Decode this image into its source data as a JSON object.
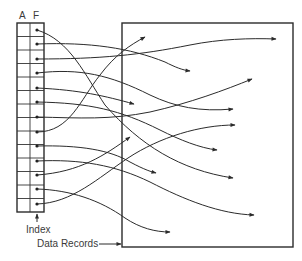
{
  "labels": {
    "col_a": "A",
    "col_f": "F",
    "index": "Index",
    "data_records": "Data Records"
  },
  "index_table": {
    "columns": [
      "A",
      "F"
    ],
    "row_count": 14
  },
  "colors": {
    "ink": "#2b2b2b",
    "background": "#ffffff"
  },
  "pointers": [
    {
      "from_row": 1,
      "to": [
        190,
        71
      ]
    },
    {
      "from_row": 2,
      "to": [
        276,
        39
      ]
    },
    {
      "from_row": 3,
      "to": [
        233,
        109
      ]
    },
    {
      "from_row": 4,
      "to": [
        252,
        79
      ]
    },
    {
      "from_row": 5,
      "to": [
        134,
        104
      ]
    },
    {
      "from_row": 6,
      "to": [
        217,
        150
      ]
    },
    {
      "from_row": 7,
      "to": [
        156,
        173
      ]
    },
    {
      "from_row": 8,
      "to": [
        145,
        37
      ]
    },
    {
      "from_row": 9,
      "to": [
        239,
        179
      ]
    },
    {
      "from_row": 10,
      "to": [
        272,
        140
      ]
    },
    {
      "from_row": 11,
      "to": [
        254,
        215
      ]
    },
    {
      "from_row": 12,
      "to": [
        130,
        137
      ]
    },
    {
      "from_row": 13,
      "to": [
        170,
        232
      ]
    }
  ]
}
